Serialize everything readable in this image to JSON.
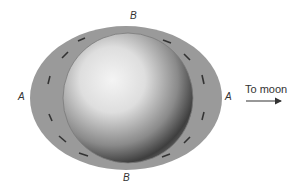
{
  "diagram": {
    "labels": {
      "top": "B",
      "bottom": "B",
      "left": "A",
      "right": "A"
    },
    "direction_label": "To moon",
    "colors": {
      "water": "#9a9a9a",
      "earth_light": "#f2f2f2",
      "earth_dark": "#3a3a3a",
      "arrow": "#333333",
      "text": "#333333"
    }
  }
}
